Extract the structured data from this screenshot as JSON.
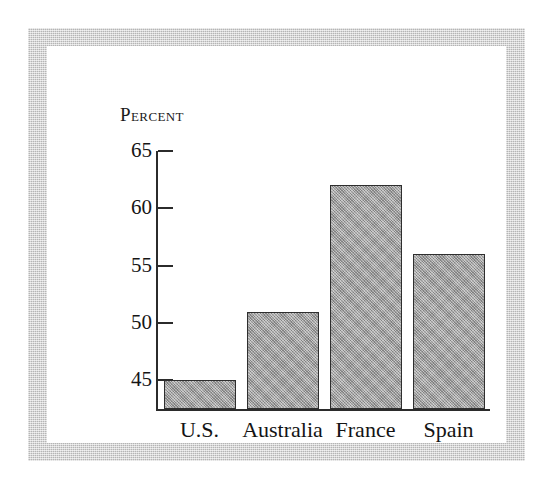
{
  "figure": {
    "background_color": "#ffffff",
    "frame_color": "#c9c9c9",
    "bar_fill_color": "#a3a3a3",
    "bar_outline_color": "#2e2e2e",
    "axis_color": "#2b2b2b"
  },
  "chart_data": {
    "type": "bar",
    "title": "",
    "subtitle": "",
    "ylabel": "Percent",
    "xlabel": "",
    "categories": [
      "U.S.",
      "Australia",
      "France",
      "Spain"
    ],
    "values": [
      45,
      51,
      62,
      56
    ],
    "ylim": [
      42.5,
      65
    ],
    "yticks": [
      45,
      50,
      55,
      60,
      65
    ],
    "ytick_labels": [
      "45",
      "50",
      "55",
      "60",
      "65"
    ],
    "grid": false,
    "legend": null,
    "annotations": [],
    "series": [
      {
        "name": "Percent",
        "values": [
          45,
          51,
          62,
          56
        ]
      }
    ]
  }
}
